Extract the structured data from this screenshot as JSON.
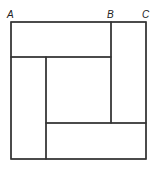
{
  "diagram": {
    "stroke_color": "#333333",
    "background": "#ffffff",
    "labels": [
      {
        "id": "A",
        "text": "A",
        "x": 7,
        "y": 10
      },
      {
        "id": "B",
        "text": "B",
        "x": 107,
        "y": 10
      },
      {
        "id": "C",
        "text": "C",
        "x": 142,
        "y": 10
      }
    ],
    "outer_square": {
      "x1": 11,
      "y1": 22,
      "x2": 146,
      "y2": 159
    },
    "rectangles": [
      {
        "name": "top-rectangle",
        "x": 11,
        "y": 22,
        "w": 100,
        "h": 35
      },
      {
        "name": "right-rectangle",
        "x": 111,
        "y": 22,
        "w": 35,
        "h": 101
      },
      {
        "name": "bottom-rectangle",
        "x": 46,
        "y": 123,
        "w": 100,
        "h": 36
      },
      {
        "name": "left-rectangle",
        "x": 11,
        "y": 57,
        "w": 35,
        "h": 102
      }
    ],
    "center_square": {
      "x": 46,
      "y": 57,
      "w": 65,
      "h": 66
    }
  }
}
